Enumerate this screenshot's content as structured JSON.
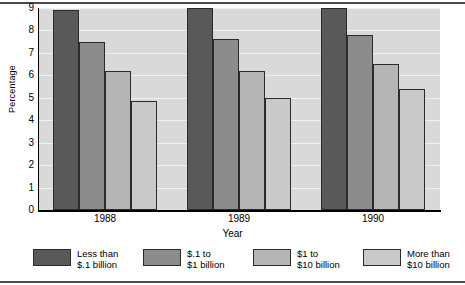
{
  "chart_data": {
    "type": "bar",
    "title": "",
    "xlabel": "Year",
    "ylabel": "Percentage",
    "categories": [
      "1988",
      "1989",
      "1990"
    ],
    "ylim": [
      0,
      9
    ],
    "yticks": [
      0,
      1,
      2,
      3,
      4,
      5,
      6,
      7,
      8,
      9
    ],
    "grid": true,
    "legend_position": "bottom",
    "series": [
      {
        "name": "Less than\n$.1 billion",
        "label_line1": "Less than",
        "label_line2": "$.1 billion",
        "color": "#595959",
        "values": [
          8.9,
          9.0,
          9.0
        ]
      },
      {
        "name": "$.1 to\n$1 billion",
        "label_line1": "$.1 to",
        "label_line2": "$1 billion",
        "color": "#8c8c8c",
        "values": [
          7.5,
          7.6,
          7.8
        ]
      },
      {
        "name": "$1 to\n$10 billion",
        "label_line1": "$1 to",
        "label_line2": "$10 billion",
        "color": "#b5b5b5",
        "values": [
          6.2,
          6.2,
          6.5
        ]
      },
      {
        "name": "More than\n$10 billion",
        "label_line1": "More than",
        "label_line2": "$10 billion",
        "color": "#c9c9c9",
        "values": [
          4.85,
          5.0,
          5.4
        ]
      }
    ]
  },
  "style": {
    "plot_background": "#d9d9d9",
    "gridline_color": "#f2f2f2",
    "axis_color": "#000000",
    "bar_border": "#2b2b2b",
    "page_background": "#ffffff"
  }
}
